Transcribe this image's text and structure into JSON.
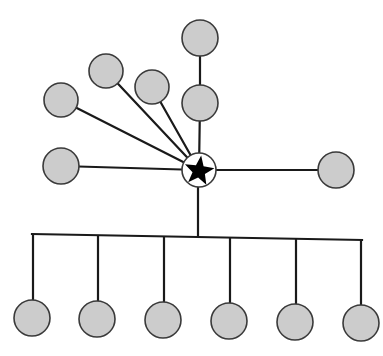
{
  "diagram": {
    "type": "hub-and-spoke network",
    "colors": {
      "node_fill": "#cccccc",
      "node_stroke": "#3a3a3a",
      "edge": "#1a1a1a",
      "hub_fill": "#ffffff",
      "star": "#000000"
    },
    "hub": {
      "id": "hub",
      "x": 199,
      "y": 170,
      "r": 17,
      "icon": "star-icon"
    },
    "nodes": [
      {
        "id": "top-outer",
        "x": 200,
        "y": 38,
        "r": 18
      },
      {
        "id": "top-inner",
        "x": 200,
        "y": 103,
        "r": 18
      },
      {
        "id": "upper-fan-1",
        "x": 152,
        "y": 87,
        "r": 17
      },
      {
        "id": "upper-fan-2",
        "x": 106,
        "y": 71,
        "r": 17
      },
      {
        "id": "upper-fan-3",
        "x": 61,
        "y": 100,
        "r": 17
      },
      {
        "id": "left",
        "x": 61,
        "y": 166,
        "r": 18
      },
      {
        "id": "right",
        "x": 336,
        "y": 170,
        "r": 18
      },
      {
        "id": "bottom-1",
        "x": 32,
        "y": 318,
        "r": 18
      },
      {
        "id": "bottom-2",
        "x": 97,
        "y": 319,
        "r": 18
      },
      {
        "id": "bottom-3",
        "x": 163,
        "y": 320,
        "r": 18
      },
      {
        "id": "bottom-4",
        "x": 229,
        "y": 321,
        "r": 18
      },
      {
        "id": "bottom-5",
        "x": 295,
        "y": 322,
        "r": 18
      },
      {
        "id": "bottom-6",
        "x": 361,
        "y": 323,
        "r": 18
      }
    ],
    "edges": [
      {
        "from": "top-outer",
        "to": "top-inner"
      },
      {
        "from": "top-inner",
        "to": "hub"
      },
      {
        "from": "upper-fan-1",
        "to": "hub"
      },
      {
        "from": "upper-fan-2",
        "to": "hub"
      },
      {
        "from": "upper-fan-3",
        "to": "hub"
      },
      {
        "from": "left",
        "to": "hub"
      },
      {
        "from": "right",
        "to": "hub"
      }
    ],
    "bus": {
      "trunk": {
        "x": 198,
        "y1": 187,
        "y2": 237
      },
      "bar": {
        "x1": 33,
        "y1": 234,
        "x2": 361,
        "y2": 240
      },
      "drops": [
        {
          "x": 33,
          "to": "bottom-1"
        },
        {
          "x": 98,
          "to": "bottom-2"
        },
        {
          "x": 164,
          "to": "bottom-3"
        },
        {
          "x": 230,
          "to": "bottom-4"
        },
        {
          "x": 296,
          "to": "bottom-5"
        },
        {
          "x": 361,
          "to": "bottom-6"
        }
      ]
    }
  }
}
